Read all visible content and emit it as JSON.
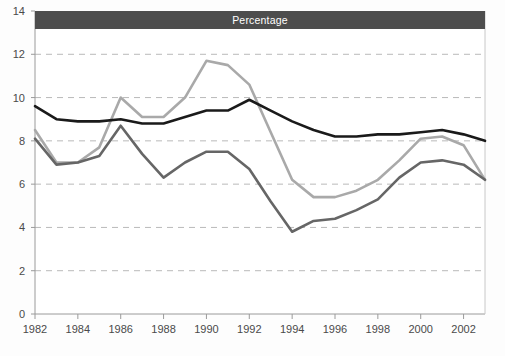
{
  "chart_data": {
    "type": "line",
    "title": "Percentage",
    "xlabel": "",
    "ylabel": "",
    "xlim": [
      1982,
      2003
    ],
    "ylim": [
      0,
      14
    ],
    "yticks": [
      0,
      2,
      4,
      6,
      8,
      10,
      12,
      14
    ],
    "xticks": [
      1982,
      1984,
      1986,
      1988,
      1990,
      1992,
      1994,
      1996,
      1998,
      2000,
      2002
    ],
    "xtick_labels": [
      "1982",
      "1984",
      "1986",
      "1988",
      "1990",
      "1992",
      "1994",
      "1996",
      "1998",
      "2000",
      "2002"
    ],
    "ytick_labels": [
      "0",
      "2",
      "4",
      "6",
      "8",
      "10",
      "12",
      "14"
    ],
    "grid": true,
    "grid_style": "dashed",
    "legend": "none",
    "x": [
      1982,
      1983,
      1984,
      1985,
      1986,
      1987,
      1988,
      1989,
      1990,
      1991,
      1992,
      1993,
      1994,
      1995,
      1996,
      1997,
      1998,
      1999,
      2000,
      2001,
      2002,
      2003
    ],
    "series": [
      {
        "name": "black-series",
        "color": "#1a1a1a",
        "values": [
          9.6,
          9.0,
          8.9,
          8.9,
          9.0,
          8.8,
          8.8,
          9.1,
          9.4,
          9.4,
          9.9,
          9.4,
          8.9,
          8.5,
          8.2,
          8.2,
          8.3,
          8.3,
          8.4,
          8.5,
          8.3,
          8.0
        ]
      },
      {
        "name": "light-gray-series",
        "color": "#a9a9a9",
        "values": [
          8.5,
          7.0,
          7.0,
          7.7,
          10.0,
          9.1,
          9.1,
          10.0,
          11.7,
          11.5,
          10.6,
          8.4,
          6.2,
          5.4,
          5.4,
          5.7,
          6.2,
          7.1,
          8.1,
          8.2,
          7.8,
          6.2
        ]
      },
      {
        "name": "dark-gray-series",
        "color": "#666666",
        "values": [
          8.1,
          6.9,
          7.0,
          7.3,
          8.7,
          7.4,
          6.3,
          7.0,
          7.5,
          7.5,
          6.7,
          5.2,
          3.8,
          4.3,
          4.4,
          4.8,
          5.3,
          6.3,
          7.0,
          7.1,
          6.9,
          6.2
        ]
      }
    ]
  },
  "plot": {
    "left": 35,
    "right": 485,
    "top": 11,
    "bottom": 314,
    "title_band_height": 18,
    "axis_color": "#9a9a9a",
    "grid_color": "#b9b9b9",
    "title_bg": "#4d4d4d",
    "title_fg": "#ffffff",
    "background": "#fdfdfd"
  }
}
